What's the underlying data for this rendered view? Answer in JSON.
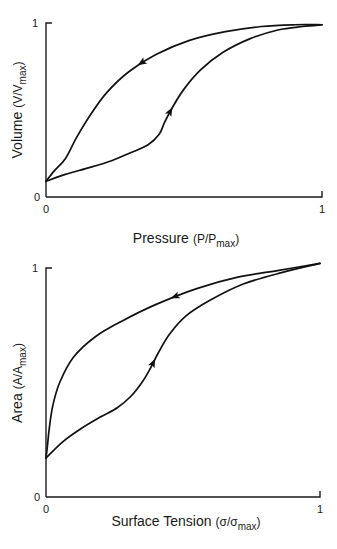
{
  "chart_data": [
    {
      "type": "line",
      "title": "",
      "xlabel": {
        "main": "Pressure",
        "paren_open": "(P/P",
        "sub": "max",
        "paren_close": ")"
      },
      "ylabel": {
        "main": "Volume",
        "paren_open": "(V/V",
        "sub": "max",
        "paren_close": ")"
      },
      "xlim": [
        0,
        1
      ],
      "ylim": [
        0,
        1
      ],
      "x_ticks": [
        "0",
        "1"
      ],
      "y_ticks": [
        "0",
        "1"
      ],
      "grid": false,
      "legend": "none",
      "series": [
        {
          "name": "inflation",
          "direction": "increasing",
          "arrow_at_fraction": 0.45,
          "points": [
            [
              0.0,
              0.09
            ],
            [
              0.07,
              0.13
            ],
            [
              0.16,
              0.17
            ],
            [
              0.24,
              0.21
            ],
            [
              0.3,
              0.25
            ],
            [
              0.37,
              0.3
            ],
            [
              0.41,
              0.36
            ],
            [
              0.43,
              0.43
            ],
            [
              0.46,
              0.52
            ],
            [
              0.5,
              0.62
            ],
            [
              0.56,
              0.73
            ],
            [
              0.64,
              0.83
            ],
            [
              0.74,
              0.91
            ],
            [
              0.84,
              0.96
            ],
            [
              0.93,
              0.98
            ],
            [
              1.0,
              0.99
            ]
          ]
        },
        {
          "name": "deflation",
          "direction": "decreasing",
          "arrow_at_fraction": 0.55,
          "points": [
            [
              1.0,
              0.99
            ],
            [
              0.9,
              0.99
            ],
            [
              0.78,
              0.98
            ],
            [
              0.65,
              0.95
            ],
            [
              0.52,
              0.9
            ],
            [
              0.4,
              0.82
            ],
            [
              0.3,
              0.72
            ],
            [
              0.22,
              0.6
            ],
            [
              0.16,
              0.47
            ],
            [
              0.11,
              0.34
            ],
            [
              0.07,
              0.22
            ],
            [
              0.03,
              0.15
            ],
            [
              0.0,
              0.09
            ]
          ]
        }
      ]
    },
    {
      "type": "line",
      "title": "",
      "xlabel": {
        "main": "Surface Tension",
        "paren_open": "(σ/σ",
        "sub": "max",
        "paren_close": ")"
      },
      "ylabel": {
        "main": "Area",
        "paren_open": "(A/A",
        "sub": "max",
        "paren_close": ")"
      },
      "xlim": [
        0,
        1
      ],
      "ylim": [
        0,
        1
      ],
      "x_ticks": [
        "0",
        "1"
      ],
      "y_ticks": [
        "0",
        "1"
      ],
      "grid": false,
      "legend": "none",
      "series": [
        {
          "name": "increasing tension",
          "direction": "increasing",
          "arrow_at_fraction": 0.42,
          "points": [
            [
              0.0,
              0.17
            ],
            [
              0.06,
              0.24
            ],
            [
              0.13,
              0.3
            ],
            [
              0.2,
              0.35
            ],
            [
              0.26,
              0.39
            ],
            [
              0.31,
              0.44
            ],
            [
              0.35,
              0.5
            ],
            [
              0.38,
              0.56
            ],
            [
              0.41,
              0.63
            ],
            [
              0.45,
              0.71
            ],
            [
              0.51,
              0.79
            ],
            [
              0.6,
              0.86
            ],
            [
              0.72,
              0.93
            ],
            [
              0.86,
              0.98
            ],
            [
              1.0,
              1.02
            ]
          ]
        },
        {
          "name": "decreasing tension",
          "direction": "decreasing",
          "arrow_at_fraction": 0.4,
          "points": [
            [
              1.0,
              1.02
            ],
            [
              0.85,
              0.99
            ],
            [
              0.7,
              0.96
            ],
            [
              0.55,
              0.91
            ],
            [
              0.4,
              0.84
            ],
            [
              0.28,
              0.77
            ],
            [
              0.18,
              0.7
            ],
            [
              0.1,
              0.61
            ],
            [
              0.05,
              0.5
            ],
            [
              0.025,
              0.4
            ],
            [
              0.012,
              0.3
            ],
            [
              0.005,
              0.22
            ],
            [
              0.0,
              0.17
            ]
          ]
        }
      ]
    }
  ]
}
